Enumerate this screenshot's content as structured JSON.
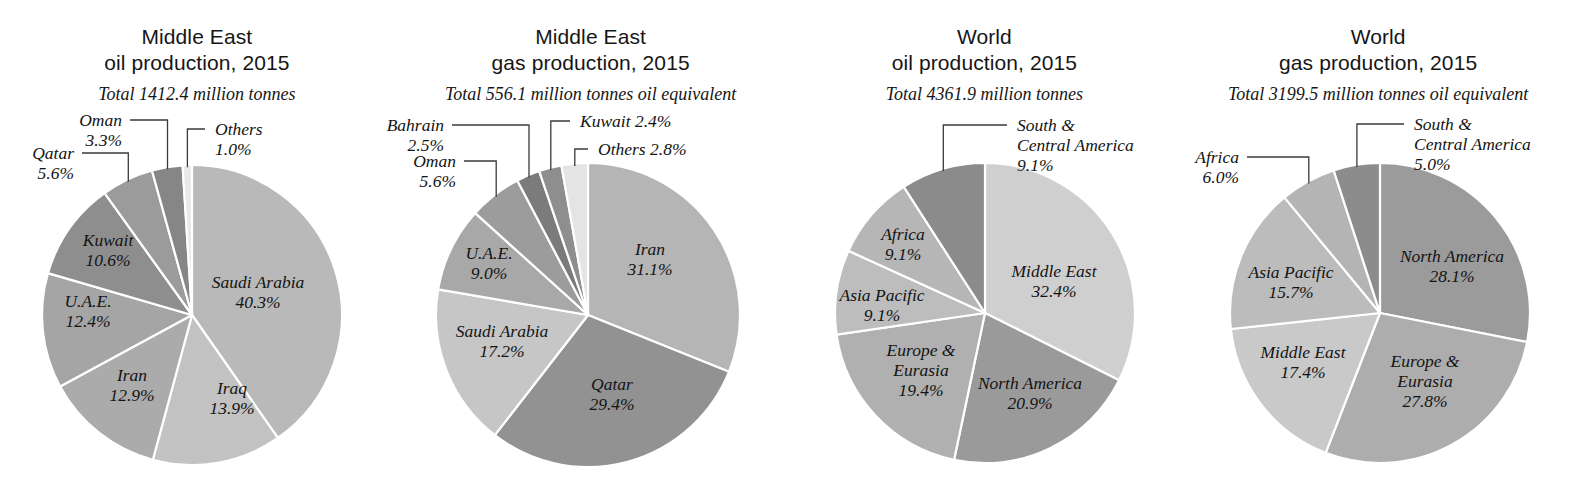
{
  "figure": {
    "width": 1575,
    "height": 492,
    "background": "#ffffff",
    "leader_color": "#3a3a3a",
    "slice_border_color": "#ffffff"
  },
  "chart_data": [
    {
      "type": "pie",
      "title_line1": "Middle East",
      "title_line2": "oil production, 2015",
      "subtitle": "Total 1412.4 million tonnes",
      "unit": "million tonnes",
      "total": 1412.4,
      "center": [
        192,
        315
      ],
      "radius": 150,
      "start_angle": 0,
      "direction": "clockwise",
      "categories": [
        "Saudi Arabia",
        "Iraq",
        "Iran",
        "U.A.E.",
        "Kuwait",
        "Qatar",
        "Oman",
        "Others"
      ],
      "values": [
        40.3,
        13.9,
        12.9,
        12.4,
        10.6,
        5.6,
        3.3,
        1.0
      ],
      "colors": [
        "#b9b9b9",
        "#c2c2c2",
        "#ababab",
        "#a5a5a5",
        "#8e8e8e",
        "#9b9b9b",
        "#868686",
        "#e9e9e9"
      ],
      "slices": [
        {
          "name": "Saudi Arabia",
          "value": 40.3,
          "label": "Saudi Arabia",
          "pct": "40.3%",
          "color": "#b9b9b9",
          "placement": "inside",
          "lx": 258,
          "ly": 288
        },
        {
          "name": "Iraq",
          "value": 13.9,
          "label": "Iraq",
          "pct": "13.9%",
          "color": "#c2c2c2",
          "placement": "inside",
          "lx": 232,
          "ly": 394
        },
        {
          "name": "Iran",
          "value": 12.9,
          "label": "Iran",
          "pct": "12.9%",
          "color": "#ababab",
          "placement": "inside",
          "lx": 132,
          "ly": 381
        },
        {
          "name": "U.A.E.",
          "value": 12.4,
          "label": "U.A.E.",
          "pct": "12.4%",
          "color": "#a5a5a5",
          "placement": "inside",
          "lx": 88,
          "ly": 307
        },
        {
          "name": "Kuwait",
          "value": 10.6,
          "label": "Kuwait",
          "pct": "10.6%",
          "color": "#8e8e8e",
          "placement": "inside",
          "lx": 108,
          "ly": 246
        },
        {
          "name": "Qatar",
          "value": 5.6,
          "label": "Qatar",
          "pct": "5.6%",
          "color": "#9b9b9b",
          "placement": "callout",
          "lx": 74,
          "ly": 159
        },
        {
          "name": "Oman",
          "value": 3.3,
          "label": "Oman",
          "pct": "3.3%",
          "color": "#868686",
          "placement": "callout",
          "lx": 122,
          "ly": 126
        },
        {
          "name": "Others",
          "value": 1.0,
          "label": "Others",
          "pct": "1.0%",
          "color": "#e9e9e9",
          "placement": "callout",
          "lx": 215,
          "ly": 135
        }
      ]
    },
    {
      "type": "pie",
      "title_line1": "Middle East",
      "title_line2": "gas production, 2015",
      "subtitle": "Total 556.1 million tonnes oil equivalent",
      "unit": "million tonnes oil equivalent",
      "total": 556.1,
      "center": [
        588,
        315
      ],
      "radius": 152,
      "start_angle": 0,
      "direction": "clockwise",
      "categories": [
        "Iran",
        "Qatar",
        "Saudi Arabia",
        "U.A.E.",
        "Oman",
        "Bahrain",
        "Kuwait",
        "Others"
      ],
      "values": [
        31.1,
        29.4,
        17.2,
        9.0,
        5.6,
        2.5,
        2.4,
        2.8
      ],
      "colors": [
        "#b5b5b5",
        "#929292",
        "#c6c6c6",
        "#a8a8a8",
        "#9c9c9c",
        "#7b7b7b",
        "#8e8e8e",
        "#e4e4e4"
      ],
      "slices": [
        {
          "name": "Iran",
          "value": 31.1,
          "label": "Iran",
          "pct": "31.1%",
          "color": "#b5b5b5",
          "placement": "inside",
          "lx": 650,
          "ly": 255
        },
        {
          "name": "Qatar",
          "value": 29.4,
          "label": "Qatar",
          "pct": "29.4%",
          "color": "#929292",
          "placement": "inside",
          "lx": 612,
          "ly": 390
        },
        {
          "name": "Saudi Arabia",
          "value": 17.2,
          "label": "Saudi Arabia",
          "pct": "17.2%",
          "color": "#c6c6c6",
          "placement": "inside",
          "lx": 502,
          "ly": 337
        },
        {
          "name": "U.A.E.",
          "value": 9.0,
          "label": "U.A.E.",
          "pct": "9.0%",
          "color": "#a8a8a8",
          "placement": "inside",
          "lx": 489,
          "ly": 259
        },
        {
          "name": "Oman",
          "value": 5.6,
          "label": "Oman",
          "pct": "5.6%",
          "color": "#9c9c9c",
          "placement": "callout",
          "lx": 456,
          "ly": 167
        },
        {
          "name": "Bahrain",
          "value": 2.5,
          "label": "Bahrain",
          "pct": "2.5%",
          "color": "#7b7b7b",
          "placement": "callout",
          "lx": 444,
          "ly": 131
        },
        {
          "name": "Kuwait",
          "value": 2.4,
          "label": "Kuwait 2.4%",
          "pct": "2.4%",
          "color": "#8e8e8e",
          "placement": "callout",
          "lx": 580,
          "ly": 127
        },
        {
          "name": "Others",
          "value": 2.8,
          "label": "Others 2.8%",
          "pct": "2.8%",
          "color": "#e4e4e4",
          "placement": "callout",
          "lx": 598,
          "ly": 155
        }
      ]
    },
    {
      "type": "pie",
      "title_line1": "World",
      "title_line2": "oil production, 2015",
      "subtitle": "Total 4361.9 million tonnes",
      "unit": "million tonnes",
      "total": 4361.9,
      "center": [
        985,
        313
      ],
      "radius": 150,
      "start_angle": 0,
      "direction": "clockwise",
      "categories": [
        "Middle East",
        "North America",
        "Europe & Eurasia",
        "Asia Pacific",
        "Africa",
        "South & Central America"
      ],
      "values": [
        32.4,
        20.9,
        19.4,
        9.1,
        9.1,
        9.1
      ],
      "colors": [
        "#cfcfcf",
        "#9a9a9a",
        "#b0b0b0",
        "#bdbdbd",
        "#b6b6b6",
        "#8b8b8b"
      ],
      "slices": [
        {
          "name": "Middle East",
          "value": 32.4,
          "label": "Middle East",
          "pct": "32.4%",
          "color": "#cfcfcf",
          "placement": "inside",
          "lx": 1054,
          "ly": 277
        },
        {
          "name": "North America",
          "value": 20.9,
          "label": "North America",
          "pct": "20.9%",
          "color": "#9a9a9a",
          "placement": "inside",
          "lx": 1030,
          "ly": 389
        },
        {
          "name": "Europe & Eurasia",
          "value": 19.4,
          "label": "Europe &",
          "label2": "Eurasia",
          "pct": "19.4%",
          "color": "#b0b0b0",
          "placement": "inside",
          "lx": 921,
          "ly": 356
        },
        {
          "name": "Asia Pacific",
          "value": 9.1,
          "label": "Asia Pacific",
          "pct": "9.1%",
          "color": "#bdbdbd",
          "placement": "inside",
          "lx": 882,
          "ly": 301
        },
        {
          "name": "Africa",
          "value": 9.1,
          "label": "Africa",
          "pct": "9.1%",
          "color": "#b6b6b6",
          "placement": "inside",
          "lx": 903,
          "ly": 240
        },
        {
          "name": "South & Central America",
          "value": 9.1,
          "label": "South &",
          "label2": "Central America",
          "pct": "9.1%",
          "color": "#8b8b8b",
          "placement": "callout",
          "lx": 1017,
          "ly": 131
        }
      ]
    },
    {
      "type": "pie",
      "title_line1": "World",
      "title_line2": "gas production, 2015",
      "subtitle": "Total 3199.5 million tonnes oil equivalent",
      "unit": "million tonnes oil equivalent",
      "total": 3199.5,
      "center": [
        1380,
        313
      ],
      "radius": 150,
      "start_angle": 0,
      "direction": "clockwise",
      "categories": [
        "North America",
        "Europe & Eurasia",
        "Middle East",
        "Asia Pacific",
        "Africa",
        "South & Central America"
      ],
      "values": [
        28.1,
        27.8,
        17.4,
        15.7,
        6.0,
        5.0
      ],
      "colors": [
        "#9b9b9b",
        "#adadad",
        "#c9c9c9",
        "#bcbcbc",
        "#b4b4b4",
        "#8c8c8c"
      ],
      "slices": [
        {
          "name": "North America",
          "value": 28.1,
          "label": "North America",
          "pct": "28.1%",
          "color": "#9b9b9b",
          "placement": "inside",
          "lx": 1452,
          "ly": 262
        },
        {
          "name": "Europe & Eurasia",
          "value": 27.8,
          "label": "Europe &",
          "label2": "Eurasia",
          "pct": "27.8%",
          "color": "#adadad",
          "placement": "inside",
          "lx": 1425,
          "ly": 367
        },
        {
          "name": "Middle East",
          "value": 17.4,
          "label": "Middle East",
          "pct": "17.4%",
          "color": "#c9c9c9",
          "placement": "inside",
          "lx": 1303,
          "ly": 358
        },
        {
          "name": "Asia Pacific",
          "value": 15.7,
          "label": "Asia Pacific",
          "pct": "15.7%",
          "color": "#bcbcbc",
          "placement": "inside",
          "lx": 1291,
          "ly": 278
        },
        {
          "name": "Africa",
          "value": 6.0,
          "label": "Africa",
          "pct": "6.0%",
          "color": "#b4b4b4",
          "placement": "callout",
          "lx": 1239,
          "ly": 163
        },
        {
          "name": "South & Central America",
          "value": 5.0,
          "label": "South &",
          "label2": "Central America",
          "pct": "5.0%",
          "color": "#8c8c8c",
          "placement": "callout",
          "lx": 1414,
          "ly": 130
        }
      ]
    }
  ]
}
